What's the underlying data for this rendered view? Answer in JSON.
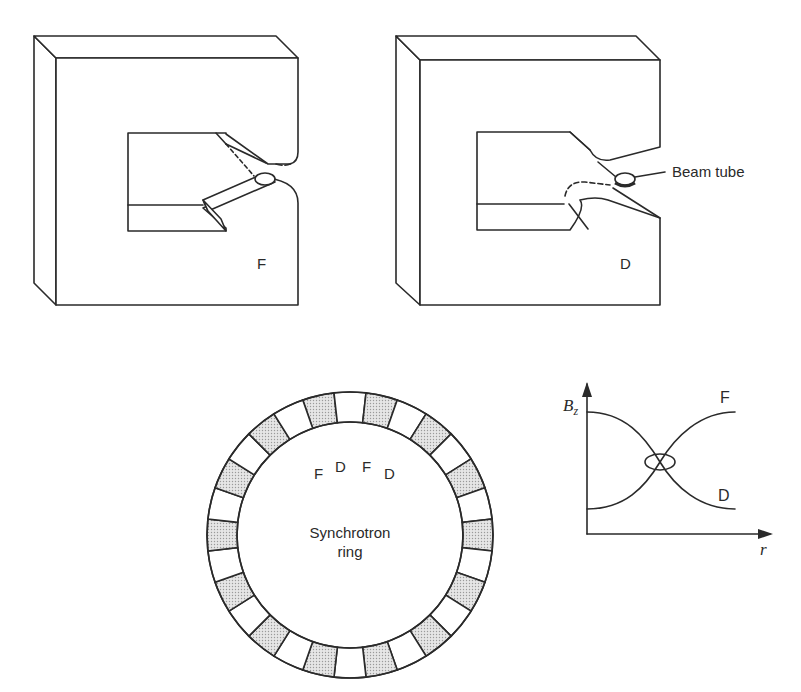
{
  "figure": {
    "magnets": [
      {
        "id": "focusing",
        "label": "F"
      },
      {
        "id": "defocusing",
        "label": "D",
        "callout": "Beam tube"
      }
    ],
    "ring": {
      "title_line1": "Synchrotron",
      "title_line2": "ring",
      "segment_labels": [
        "F",
        "D",
        "F",
        "D"
      ],
      "segment_count": 28,
      "shaded_color": "#d8d8d8"
    },
    "field_plot": {
      "y_axis_label": "B",
      "y_axis_subscript": "z",
      "x_axis_label": "r",
      "curve_labels": {
        "upper": "F",
        "lower": "D"
      }
    }
  },
  "colors": {
    "ink": "#2a2a2a",
    "background": "#ffffff",
    "shade": "#d8d8d8"
  }
}
